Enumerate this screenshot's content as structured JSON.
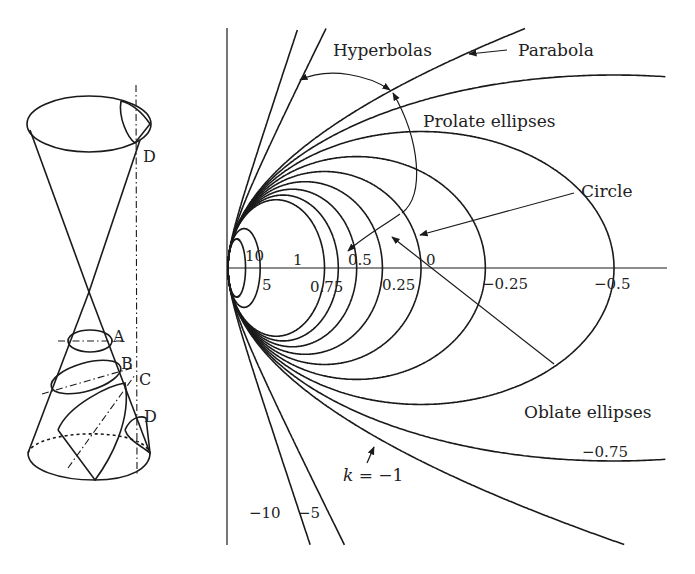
{
  "figure": {
    "cone": {
      "labels": [
        {
          "id": "A",
          "text": "A",
          "x": 113,
          "y": 342
        },
        {
          "id": "B",
          "text": "B",
          "x": 121,
          "y": 369
        },
        {
          "id": "C",
          "text": "C",
          "x": 139,
          "y": 385
        },
        {
          "id": "D-bottom",
          "text": "D",
          "x": 144,
          "y": 422
        },
        {
          "id": "D-top",
          "text": "D",
          "x": 143,
          "y": 162
        }
      ]
    },
    "conics": {
      "vertex": {
        "x": 228,
        "y": 268
      },
      "radius_px": 96.5,
      "k_values": [
        10,
        5,
        1,
        0.75,
        0.5,
        0.25,
        0,
        -0.25,
        -0.5,
        -0.75,
        -1,
        -5,
        -10
      ],
      "axis_labels": [
        {
          "text": "10",
          "x": 245,
          "y": 261
        },
        {
          "text": "5",
          "x": 262,
          "y": 290
        },
        {
          "text": "1",
          "x": 293,
          "y": 265
        },
        {
          "text": "0.75",
          "x": 310,
          "y": 292
        },
        {
          "text": "0.5",
          "x": 348,
          "y": 265
        },
        {
          "text": "0.25",
          "x": 382,
          "y": 290
        },
        {
          "text": "0",
          "x": 426,
          "y": 265
        },
        {
          "text": "−0.25",
          "x": 482,
          "y": 289
        },
        {
          "text": "−0.5",
          "x": 594,
          "y": 289
        },
        {
          "text": "−0.75",
          "x": 582,
          "y": 457
        },
        {
          "text": "−10",
          "x": 249,
          "y": 518
        },
        {
          "text": "−5",
          "x": 298,
          "y": 518
        }
      ],
      "callouts": [
        {
          "id": "hyperbolas",
          "text": "Hyperbolas",
          "x": 333,
          "y": 56
        },
        {
          "id": "parabola",
          "text": "Parabola",
          "x": 518,
          "y": 56
        },
        {
          "id": "prolate-ellipses",
          "text": "Prolate ellipses",
          "x": 423,
          "y": 127
        },
        {
          "id": "circle",
          "text": "Circle",
          "x": 581,
          "y": 197
        },
        {
          "id": "oblate-ellipses",
          "text": "Oblate ellipses",
          "x": 524,
          "y": 418
        },
        {
          "id": "k-minus-1",
          "text": "k = −1",
          "x": 343,
          "y": 481
        }
      ]
    }
  }
}
